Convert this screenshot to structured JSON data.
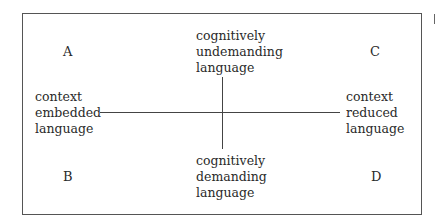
{
  "diagram": {
    "quadrants": {
      "top_left": "A",
      "top_right": "C",
      "bottom_left": "B",
      "bottom_right": "D"
    },
    "axes": {
      "top": [
        "cognitively",
        "undemanding",
        "language"
      ],
      "bottom": [
        "cognitively",
        "demanding",
        "language"
      ],
      "left": [
        "context",
        "embedded",
        "language"
      ],
      "right": [
        "context",
        "reduced",
        "language"
      ]
    }
  }
}
